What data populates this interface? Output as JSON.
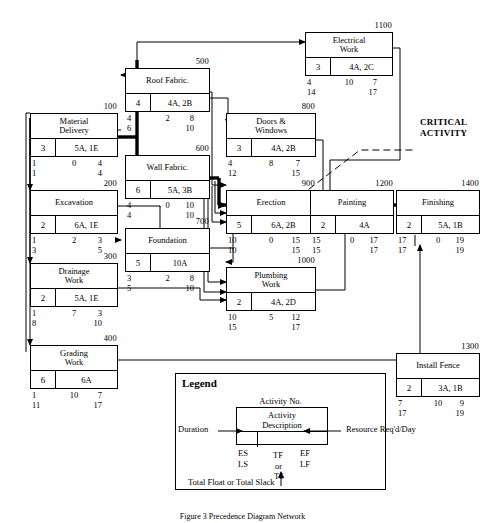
{
  "diagram": {
    "critical_label": "CRITICAL\nACTIVITY",
    "critical_label_line1": "CRITICAL",
    "critical_label_line2": "ACTIVITY",
    "caption": "Figure 3  Precedence Diagram Network",
    "colors": {
      "line": "#000000",
      "critical": "#000000",
      "background": "#ffffff"
    }
  },
  "nodes": [
    {
      "id": "100",
      "name": "Material\nDelivery",
      "line1": "Material",
      "line2": "Delivery",
      "duration": "3",
      "resource": "5A, 1E",
      "es": "1",
      "tf": "0",
      "ef": "4",
      "ls": "1",
      "lf": "4",
      "critical": true
    },
    {
      "id": "200",
      "name": "Excavation",
      "line1": "Excavation",
      "line2": "",
      "duration": "2",
      "resource": "6A, 1E",
      "es": "1",
      "tf": "2",
      "ef": "3",
      "ls": "3",
      "lf": "5",
      "critical": false
    },
    {
      "id": "300",
      "name": "Drainage\nWork",
      "line1": "Drainage",
      "line2": "Work",
      "duration": "2",
      "resource": "5A, 1E",
      "es": "1",
      "tf": "7",
      "ef": "3",
      "ls": "8",
      "lf": "10",
      "critical": false
    },
    {
      "id": "400",
      "name": "Grading\nWork",
      "line1": "Grading",
      "line2": "Work",
      "duration": "6",
      "resource": "6A",
      "es": "1",
      "tf": "10",
      "ef": "7",
      "ls": "11",
      "lf": "17",
      "critical": false
    },
    {
      "id": "500",
      "name": "Roof Fabric.",
      "line1": "Roof Fabric.",
      "line2": "",
      "duration": "4",
      "resource": "4A, 2B",
      "es": "4",
      "tf": "2",
      "ef": "8",
      "ls": "6",
      "lf": "10",
      "critical": false
    },
    {
      "id": "600",
      "name": "Wall Fabric.",
      "line1": "Wall Fabric.",
      "line2": "",
      "duration": "6",
      "resource": "5A, 3B",
      "es": "4",
      "tf": "0",
      "ef": "10",
      "ls": "4",
      "lf": "10",
      "critical": true
    },
    {
      "id": "700",
      "name": "Foundation",
      "line1": "Foundation",
      "line2": "",
      "duration": "5",
      "resource": "10A",
      "es": "3",
      "tf": "2",
      "ef": "8",
      "ls": "5",
      "lf": "10",
      "critical": false
    },
    {
      "id": "800",
      "name": "Doors &\nWindows",
      "line1": "Doors &",
      "line2": "Windows",
      "duration": "3",
      "resource": "4A, 2B",
      "es": "4",
      "tf": "8",
      "ef": "7",
      "ls": "12",
      "lf": "15",
      "critical": false
    },
    {
      "id": "900",
      "name": "Erection",
      "line1": "Erection",
      "line2": "",
      "duration": "5",
      "resource": "6A, 2B",
      "es": "10",
      "tf": "0",
      "ef": "15",
      "ls": "10",
      "lf": "15",
      "critical": true
    },
    {
      "id": "1000",
      "name": "Plumbing\nWork",
      "line1": "Plumbing",
      "line2": "Work",
      "duration": "2",
      "resource": "4A, 2D",
      "es": "10",
      "tf": "5",
      "ef": "12",
      "ls": "15",
      "lf": "17",
      "critical": false
    },
    {
      "id": "1100",
      "name": "Electrical\nWork",
      "line1": "Electrical",
      "line2": "Work",
      "duration": "3",
      "resource": "4A, 2C",
      "es": "4",
      "tf": "10",
      "ef": "7",
      "ls": "14",
      "lf": "17",
      "critical": false
    },
    {
      "id": "1200",
      "name": "Painting",
      "line1": "Painting",
      "line2": "",
      "duration": "2",
      "resource": "4A",
      "es": "15",
      "tf": "0",
      "ef": "17",
      "ls": "15",
      "lf": "17",
      "critical": true
    },
    {
      "id": "1300",
      "name": "Install Fence",
      "line1": "Install Fence",
      "line2": "",
      "duration": "2",
      "resource": "3A, 1B",
      "es": "7",
      "tf": "10",
      "ef": "9",
      "ls": "17",
      "lf": "19",
      "critical": false
    },
    {
      "id": "1400",
      "name": "Finishing",
      "line1": "Finishing",
      "line2": "",
      "duration": "2",
      "resource": "5A, 1B",
      "es": "17",
      "tf": "0",
      "ef": "19",
      "ls": "17",
      "lf": "19",
      "critical": true
    }
  ],
  "legend": {
    "title": "Legend",
    "activity_no": "Activity No.",
    "desc_line1": "Activity",
    "desc_line2": "Description",
    "duration": "Duration",
    "resource": "Resource  Req'd/Day",
    "es": "ES",
    "ls": "LS",
    "tf": "TF",
    "or": "or",
    "ts": "TS",
    "ef": "EF",
    "lf": "LF",
    "total_float": "Total Float or Total Slack"
  }
}
